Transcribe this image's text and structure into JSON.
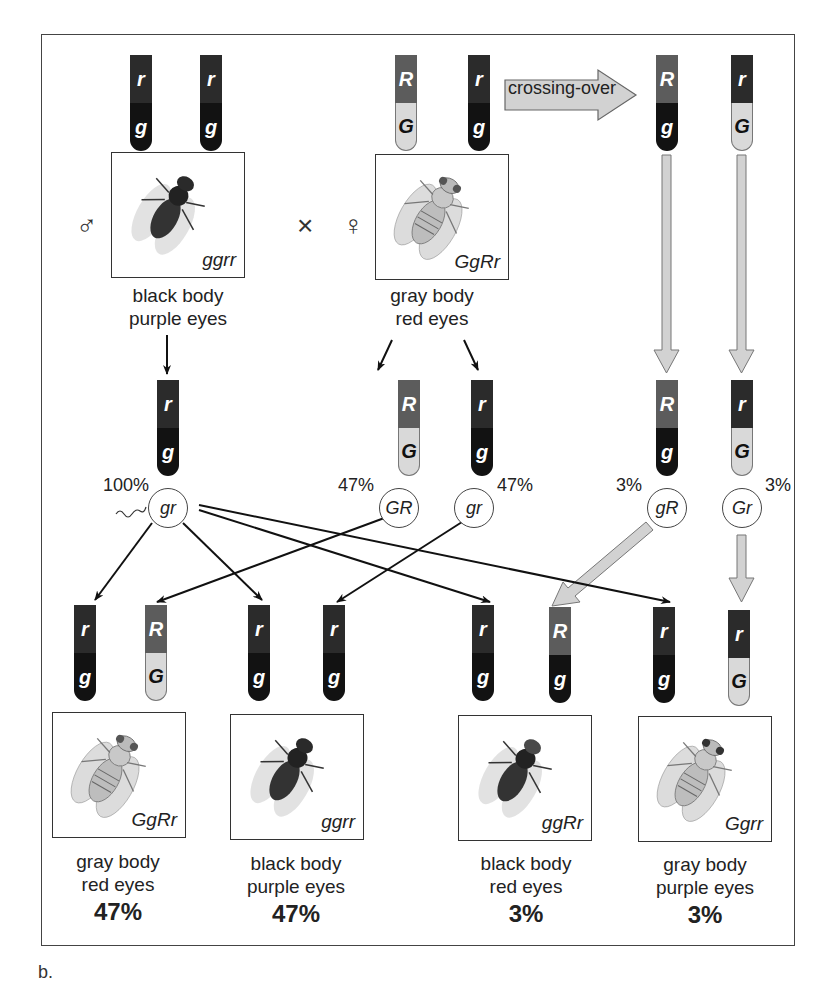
{
  "figure": {
    "panel_label": "b.",
    "cross_symbol": "×",
    "male_symbol": "♂",
    "female_symbol": "♀",
    "crossing_over_label": "crossing-over"
  },
  "colors": {
    "R": "#5c5c5c",
    "r": "#2b2b2b",
    "G": "#d9d9d9",
    "g": "#121212",
    "frame": "#444444",
    "gray_arrow": "#cfcfcf"
  },
  "parents": {
    "male": {
      "chromosomes": [
        {
          "top": "r",
          "bottom": "g"
        },
        {
          "top": "r",
          "bottom": "g"
        }
      ],
      "genotype": "ggrr",
      "phenotype_line1": "black body",
      "phenotype_line2": "purple eyes"
    },
    "female": {
      "chromosomes": [
        {
          "top": "R",
          "bottom": "G"
        },
        {
          "top": "r",
          "bottom": "g"
        }
      ],
      "genotype": "GgRr",
      "phenotype_line1": "gray body",
      "phenotype_line2": "red eyes"
    },
    "recombinant_chromosomes": [
      {
        "top": "R",
        "bottom": "g"
      },
      {
        "top": "r",
        "bottom": "G"
      }
    ]
  },
  "gametes": [
    {
      "label": "gr",
      "percent": "100%",
      "source": "male",
      "chromosome": {
        "top": "r",
        "bottom": "g"
      }
    },
    {
      "label": "GR",
      "percent": "47%",
      "source": "female parental",
      "chromosome": {
        "top": "R",
        "bottom": "G"
      }
    },
    {
      "label": "gr",
      "percent": "47%",
      "source": "female parental",
      "chromosome": {
        "top": "r",
        "bottom": "g"
      }
    },
    {
      "label": "gR",
      "percent": "3%",
      "source": "female recombinant",
      "chromosome": {
        "top": "R",
        "bottom": "g"
      }
    },
    {
      "label": "Gr",
      "percent": "3%",
      "source": "female recombinant",
      "chromosome": {
        "top": "r",
        "bottom": "G"
      }
    }
  ],
  "offspring": [
    {
      "chromosomes": [
        {
          "top": "r",
          "bottom": "g"
        },
        {
          "top": "R",
          "bottom": "G"
        }
      ],
      "genotype": "GgRr",
      "phenotype_line1": "gray body",
      "phenotype_line2": "red eyes",
      "percent": "47%"
    },
    {
      "chromosomes": [
        {
          "top": "r",
          "bottom": "g"
        },
        {
          "top": "r",
          "bottom": "g"
        }
      ],
      "genotype": "ggrr",
      "phenotype_line1": "black body",
      "phenotype_line2": "purple eyes",
      "percent": "47%"
    },
    {
      "chromosomes": [
        {
          "top": "r",
          "bottom": "g"
        },
        {
          "top": "R",
          "bottom": "g"
        }
      ],
      "genotype": "ggRr",
      "phenotype_line1": "black body",
      "phenotype_line2": "red eyes",
      "percent": "3%"
    },
    {
      "chromosomes": [
        {
          "top": "r",
          "bottom": "g"
        },
        {
          "top": "r",
          "bottom": "G"
        }
      ],
      "genotype": "Ggrr",
      "phenotype_line1": "gray body",
      "phenotype_line2": "purple eyes",
      "percent": "3%"
    }
  ]
}
